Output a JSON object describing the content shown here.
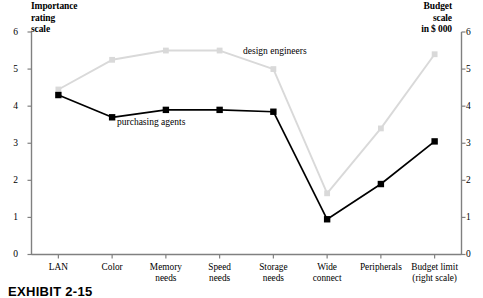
{
  "chart_data": {
    "type": "line",
    "title": "",
    "subtitle": "",
    "caption": "EXHIBIT 2-15",
    "categories": [
      "LAN",
      "Color",
      "Memory needs",
      "Speed needs",
      "Storage needs",
      "Wide connect",
      "Peripherals",
      "Budget limit (right scale)"
    ],
    "category_lines": [
      [
        "LAN"
      ],
      [
        "Color"
      ],
      [
        "Memory",
        "needs"
      ],
      [
        "Speed",
        "needs"
      ],
      [
        "Storage",
        "needs"
      ],
      [
        "Wide",
        "connect"
      ],
      [
        "Peripherals"
      ],
      [
        "Budget limit",
        "(right scale)"
      ]
    ],
    "series": [
      {
        "name": "design engineers",
        "color": "#d9d9d9",
        "marker": "square",
        "values": [
          4.45,
          5.25,
          5.5,
          5.5,
          5.0,
          1.65,
          3.4,
          5.4
        ]
      },
      {
        "name": "purchasing agents",
        "color": "#000000",
        "marker": "square",
        "values": [
          4.3,
          3.7,
          3.9,
          3.9,
          3.85,
          0.95,
          1.9,
          3.05
        ]
      }
    ],
    "left_axis": {
      "label": "Importance rating scale",
      "label_lines": [
        "Importance",
        "rating",
        "scale"
      ],
      "ticks": [
        0,
        1,
        2,
        3,
        4,
        5,
        6
      ],
      "tick_labels": [
        "0",
        "1",
        "2",
        "3",
        "4",
        "5",
        "6"
      ],
      "min": 0,
      "max": 6
    },
    "right_axis": {
      "label": "Budget scale in $ 000",
      "label_lines": [
        "Budget",
        "scale",
        "in $ 000"
      ],
      "ticks": [
        0,
        1,
        2,
        3,
        4,
        5,
        6
      ],
      "tick_labels": [
        "0",
        "1",
        "2",
        "3",
        "4",
        "5",
        "6"
      ],
      "min": 0,
      "max": 6
    },
    "xlabel": "",
    "grid": false,
    "legend": "inline-annotations"
  }
}
